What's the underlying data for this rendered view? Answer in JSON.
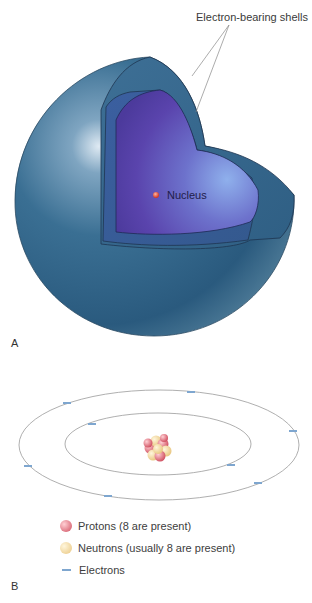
{
  "panel_a": {
    "letter": "A",
    "callout_label": "Electron-bearing shells",
    "nucleus_label": "Nucleus",
    "colors": {
      "outer_shell": "#2f6486",
      "inner_shell": "#2e5d8e",
      "core": "#5a46b0",
      "core_highlight": "#7f9be0",
      "nucleus_dot": "#d8402e"
    }
  },
  "panel_b": {
    "letter": "B",
    "orbits": [
      {
        "name": "inner-orbit",
        "electrons": 2
      },
      {
        "name": "outer-orbit",
        "electrons": 6
      }
    ],
    "colors": {
      "orbit_line": "#9a9a9a",
      "electron": "#7ea6cf",
      "proton": "#d9616c",
      "neutron": "#f0d79a"
    }
  },
  "legend": {
    "items": [
      {
        "icon": "proton-sphere-icon",
        "label": "Protons  (8 are present)",
        "color": "#d9616c"
      },
      {
        "icon": "neutron-sphere-icon",
        "label": "Neutrons (usually 8 are present)",
        "color": "#f0d79a"
      },
      {
        "icon": "electron-dash-icon",
        "label": "Electrons",
        "color": "#7ea6cf"
      }
    ]
  }
}
